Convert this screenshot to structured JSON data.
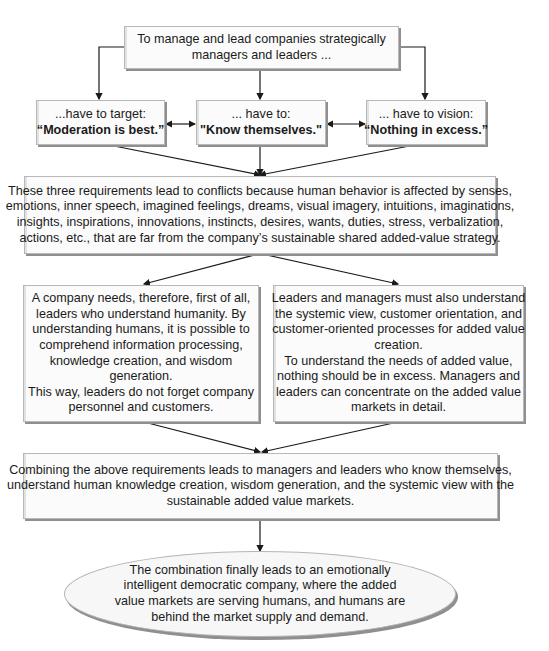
{
  "diagram": {
    "top_box": {
      "lines": [
        "To manage and lead companies strategically",
        "managers and leaders ..."
      ]
    },
    "requirements": [
      {
        "prefix": "...have to target:",
        "motto": "“Moderation is best.”"
      },
      {
        "prefix": "... have to:",
        "motto": "\"Know themselves.\""
      },
      {
        "prefix": "... have to vision:",
        "motto": "“Nothing in excess.”"
      }
    ],
    "conflict_box": {
      "lines": [
        "These three requirements lead to conflicts because human behavior is affected by senses,",
        "emotions, inner speech, imagined feelings, dreams, visual imagery, intuitions, imaginations,",
        "insights, inspirations, innovations, instincts, desires, wants, duties, stress, verbalization,",
        "actions, etc., that are far from the company’s sustainable shared added-value strategy."
      ]
    },
    "left_box": {
      "lines": [
        "A company needs, therefore, first of all,",
        "leaders who understand humanity. By",
        "understanding humans, it is possible to",
        "comprehend information processing,",
        "knowledge creation, and wisdom",
        "generation.",
        "This way, leaders do not forget company",
        "personnel and customers."
      ]
    },
    "right_box": {
      "lines": [
        "Leaders and managers must also understand",
        "the systemic view, customer orientation, and",
        "customer-oriented processes for added value",
        "creation.",
        "To understand the needs of added value,",
        "nothing should be in excess. Managers and",
        "leaders can concentrate on  the added value",
        "markets in detail."
      ]
    },
    "combine_box": {
      "lines": [
        "Combining the above requirements leads to managers and leaders who know themselves,",
        "understand human knowledge creation, wisdom generation, and the systemic view with the",
        "sustainable added value markets."
      ]
    },
    "final_ellipse": {
      "lines": [
        "The combination finally leads to an emotionally",
        "intelligent democratic company, where the added",
        "value markets are serving humans, and humans are",
        "behind the market supply and demand."
      ]
    }
  },
  "colors": {
    "box_fill": "#fbfbfb",
    "box_border": "#b8b8b8",
    "shadow": "#8f8f8f",
    "line": "#1a1a1a"
  }
}
